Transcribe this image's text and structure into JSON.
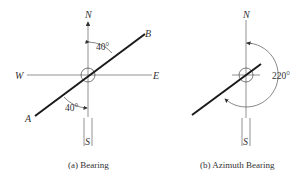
{
  "figures": [
    {
      "id": "a",
      "caption": "(a) Bearing",
      "labels": {
        "north": "N",
        "south": "S",
        "east": "E",
        "west": "W",
        "point_a": "A",
        "point_b": "B"
      },
      "angles": [
        {
          "text": "40°",
          "from": "N",
          "to": "B"
        },
        {
          "text": "40°",
          "from": "S",
          "to": "A"
        }
      ]
    },
    {
      "id": "b",
      "caption": "(b) Azimuth Bearing",
      "labels": {
        "north": "N",
        "south": "S"
      },
      "angles": [
        {
          "text": "220°",
          "from": "N",
          "direction": "clockwise"
        }
      ]
    }
  ],
  "colors": {
    "line": "#1a1a1a",
    "axis": "#777777",
    "text": "#333333",
    "background": "#ffffff"
  }
}
